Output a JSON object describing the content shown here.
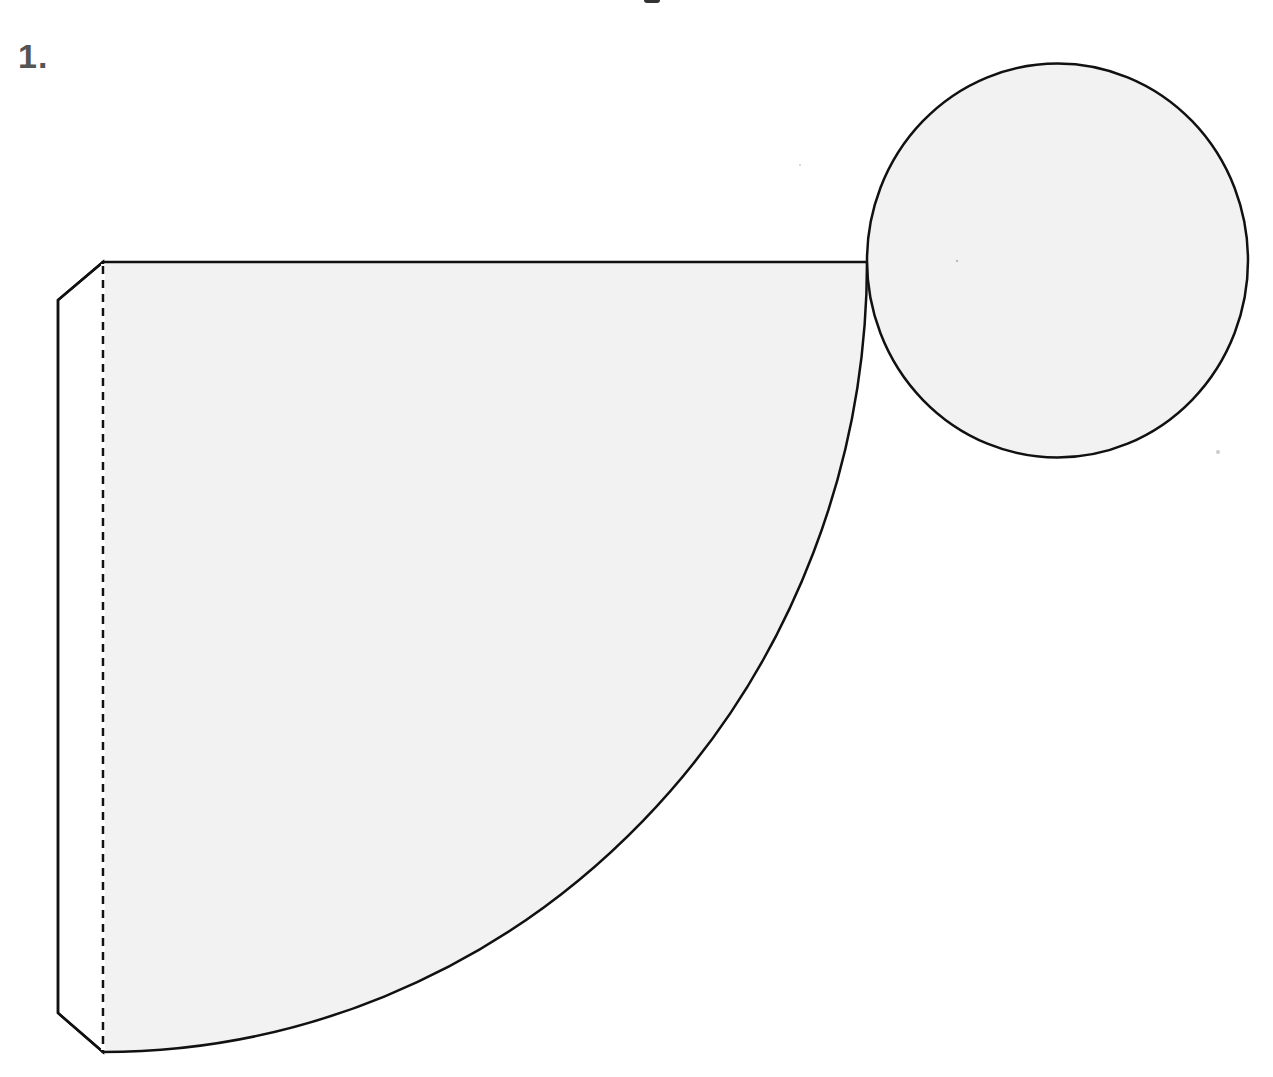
{
  "figure": {
    "label": "1.",
    "colors": {
      "background": "#ffffff",
      "fill": "#f2f2f2",
      "stroke": "#111111",
      "label": "#555555"
    },
    "parts": [
      {
        "name": "sector",
        "type": "quarter-circle sector",
        "apex": [
          103,
          262
        ],
        "top_edge_end": [
          867,
          262
        ],
        "arc_end": [
          103,
          1052
        ]
      },
      {
        "name": "glue-tab",
        "type": "trapezoid tab",
        "fold_line": "dashed"
      },
      {
        "name": "base-circle",
        "type": "circle",
        "center": [
          1057,
          261
        ],
        "radius": 192
      }
    ]
  }
}
